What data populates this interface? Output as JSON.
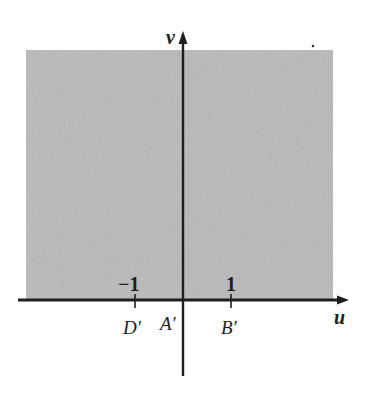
{
  "diagram": {
    "region": {
      "label": "shaded upper half-plane (v >= 0)",
      "fill_color": "#b9b9b9"
    },
    "axes": {
      "horizontal": {
        "name": "u"
      },
      "vertical": {
        "name": "v"
      },
      "color": "#1e1e1e"
    },
    "ticks": [
      {
        "value": "-1",
        "display": "−1",
        "point_label": "D′"
      },
      {
        "value": "1",
        "display": "1",
        "point_label": "B′"
      }
    ],
    "origin_label": "A′"
  }
}
